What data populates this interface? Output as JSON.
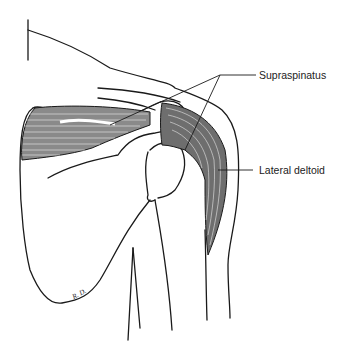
{
  "figure": {
    "labels": [
      {
        "id": "supraspinatus",
        "text": "Supraspinatus"
      },
      {
        "id": "lateral_deltoid",
        "text": "Lateral deltoid"
      }
    ],
    "signature": "R. D.",
    "colors": {
      "line": "#1a1a1a",
      "muscle_fill": "#7a7a7a",
      "background": "#ffffff"
    }
  }
}
